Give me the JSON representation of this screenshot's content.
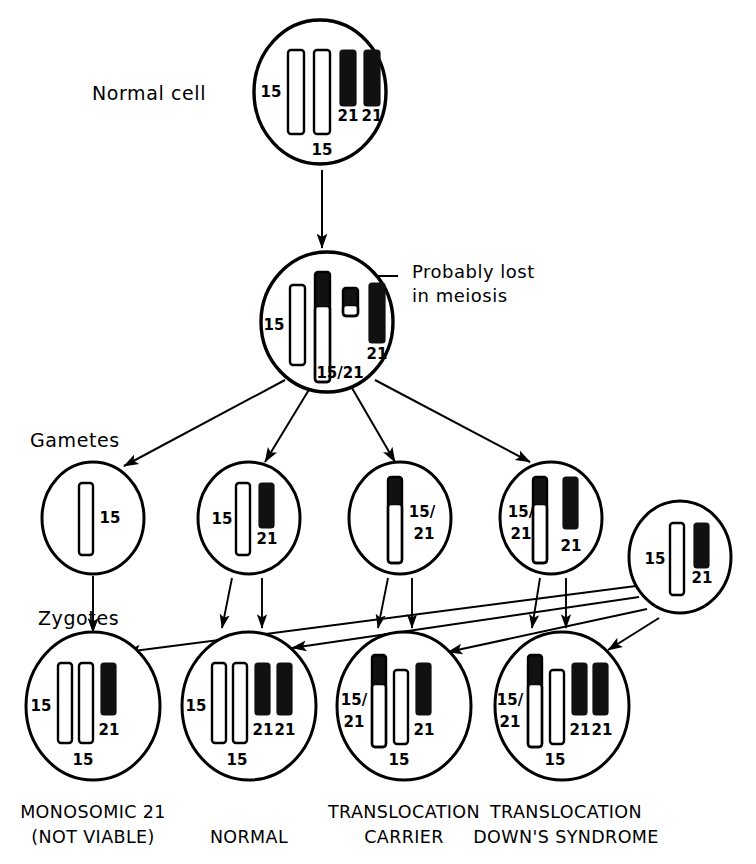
{
  "figure": {
    "line_color": "#000000",
    "fill_white": "#ffffff",
    "fill_black": "#111111"
  },
  "row_labels": {
    "normal_cell": "Normal cell",
    "gametes": "Gametes",
    "zygotes": "Zygotes"
  },
  "annotations": {
    "probably_lost_line1": "Probably lost",
    "probably_lost_line2": "in meiosis"
  },
  "cells": {
    "normal_cell": {
      "name": "normal-cell",
      "cx": 320,
      "cy": 92,
      "rx": 66,
      "ry": 72,
      "chromosomes": [
        {
          "id": "n15a",
          "type": "white",
          "x": 288,
          "y": 50,
          "w": 16,
          "h": 84
        },
        {
          "id": "n15b",
          "type": "white",
          "x": 314,
          "y": 50,
          "w": 16,
          "h": 84
        },
        {
          "id": "n21a",
          "type": "black",
          "x": 340,
          "y": 50,
          "w": 16,
          "h": 56
        },
        {
          "id": "n21b",
          "type": "black",
          "x": 364,
          "y": 50,
          "w": 16,
          "h": 56
        }
      ],
      "labels": [
        {
          "text": "15",
          "x": 271,
          "y": 92,
          "anchor": "middle"
        },
        {
          "text": "15",
          "x": 322,
          "y": 150,
          "anchor": "middle"
        },
        {
          "text": "21",
          "x": 348,
          "y": 116,
          "anchor": "middle"
        },
        {
          "text": "21",
          "x": 372,
          "y": 116,
          "anchor": "middle"
        }
      ]
    },
    "meiosis_cell": {
      "name": "meiosis-cell",
      "cx": 327,
      "cy": 322,
      "rx": 66,
      "ry": 70,
      "chromosomes": [
        {
          "id": "m15",
          "type": "white",
          "x": 290,
          "y": 285,
          "w": 15,
          "h": 80
        },
        {
          "id": "m1521",
          "type": "split",
          "x": 315,
          "y": 272,
          "w": 15,
          "h": 110,
          "black_h": 34
        },
        {
          "id": "mfrag",
          "type": "split",
          "x": 343,
          "y": 288,
          "w": 15,
          "h": 28,
          "black_h": 17
        },
        {
          "id": "m21",
          "type": "black",
          "x": 369,
          "y": 283,
          "w": 16,
          "h": 60
        }
      ],
      "labels": [
        {
          "text": "15",
          "x": 274,
          "y": 325,
          "anchor": "middle"
        },
        {
          "text": "15/21",
          "x": 340,
          "y": 373,
          "anchor": "middle"
        },
        {
          "text": "21",
          "x": 377,
          "y": 354,
          "anchor": "middle"
        }
      ]
    },
    "gametes": [
      {
        "name": "gamete-15",
        "cx": 93,
        "cy": 518,
        "rx": 51,
        "ry": 56,
        "chromosomes": [
          {
            "id": "g1-15",
            "type": "white",
            "x": 79,
            "y": 483,
            "w": 14,
            "h": 72
          }
        ],
        "labels": [
          {
            "text": "15",
            "x": 110,
            "y": 518,
            "anchor": "middle"
          }
        ]
      },
      {
        "name": "gamete-15-21",
        "cx": 249,
        "cy": 518,
        "rx": 51,
        "ry": 56,
        "chromosomes": [
          {
            "id": "g2-15",
            "type": "white",
            "x": 236,
            "y": 483,
            "w": 14,
            "h": 72
          },
          {
            "id": "g2-21",
            "type": "black",
            "x": 259,
            "y": 483,
            "w": 15,
            "h": 45
          }
        ],
        "labels": [
          {
            "text": "15",
            "x": 222,
            "y": 519,
            "anchor": "middle"
          },
          {
            "text": "21",
            "x": 267,
            "y": 539,
            "anchor": "middle"
          }
        ]
      },
      {
        "name": "gamete-translocation",
        "cx": 400,
        "cy": 518,
        "rx": 51,
        "ry": 56,
        "chromosomes": [
          {
            "id": "g3-1521",
            "type": "split",
            "x": 388,
            "y": 477,
            "w": 14,
            "h": 86,
            "black_h": 27
          }
        ],
        "labels": [
          {
            "text": "15/",
            "x": 422,
            "y": 512,
            "anchor": "middle"
          },
          {
            "text": "21",
            "x": 424,
            "y": 534,
            "anchor": "middle"
          }
        ]
      },
      {
        "name": "gamete-translocation-plus-21",
        "cx": 551,
        "cy": 518,
        "rx": 51,
        "ry": 56,
        "chromosomes": [
          {
            "id": "g4-1521",
            "type": "split",
            "x": 533,
            "y": 477,
            "w": 14,
            "h": 86,
            "black_h": 27
          },
          {
            "id": "g4-21",
            "type": "black",
            "x": 563,
            "y": 477,
            "w": 15,
            "h": 52
          }
        ],
        "labels": [
          {
            "text": "15/",
            "x": 521,
            "y": 512,
            "anchor": "middle"
          },
          {
            "text": "21",
            "x": 521,
            "y": 534,
            "anchor": "middle"
          },
          {
            "text": "21",
            "x": 571,
            "y": 546,
            "anchor": "middle"
          }
        ]
      },
      {
        "name": "gamete-paternal-normal",
        "cx": 680,
        "cy": 557,
        "rx": 51,
        "ry": 56,
        "chromosomes": [
          {
            "id": "g5-15",
            "type": "white",
            "x": 670,
            "y": 523,
            "w": 14,
            "h": 72
          },
          {
            "id": "g5-21",
            "type": "black",
            "x": 694,
            "y": 523,
            "w": 15,
            "h": 45
          }
        ],
        "labels": [
          {
            "text": "15",
            "x": 655,
            "y": 559,
            "anchor": "middle"
          },
          {
            "text": "21",
            "x": 702,
            "y": 578,
            "anchor": "middle"
          }
        ]
      }
    ],
    "zygotes": [
      {
        "name": "zygote-monosomic-21",
        "cx": 93,
        "cy": 706,
        "rx": 67,
        "ry": 74,
        "caption_line1": "MONOSOMIC 21",
        "caption_line2": "(NOT VIABLE)",
        "caption_x": 93,
        "chromosomes": [
          {
            "id": "z1-15a",
            "type": "white",
            "x": 58,
            "y": 663,
            "w": 14,
            "h": 80
          },
          {
            "id": "z1-15b",
            "type": "white",
            "x": 79,
            "y": 663,
            "w": 14,
            "h": 80
          },
          {
            "id": "z1-21",
            "type": "black",
            "x": 101,
            "y": 663,
            "w": 15,
            "h": 52
          }
        ],
        "labels": [
          {
            "text": "15",
            "x": 41,
            "y": 706,
            "anchor": "middle"
          },
          {
            "text": "15",
            "x": 83,
            "y": 760,
            "anchor": "middle"
          },
          {
            "text": "21",
            "x": 109,
            "y": 730,
            "anchor": "middle"
          }
        ]
      },
      {
        "name": "zygote-normal",
        "cx": 249,
        "cy": 706,
        "rx": 67,
        "ry": 74,
        "caption_line1": "NORMAL",
        "caption_line2": "",
        "caption_x": 249,
        "chromosomes": [
          {
            "id": "z2-15a",
            "type": "white",
            "x": 212,
            "y": 663,
            "w": 14,
            "h": 80
          },
          {
            "id": "z2-15b",
            "type": "white",
            "x": 233,
            "y": 663,
            "w": 14,
            "h": 80
          },
          {
            "id": "z2-21a",
            "type": "black",
            "x": 255,
            "y": 663,
            "w": 15,
            "h": 52
          },
          {
            "id": "z2-21b",
            "type": "black",
            "x": 277,
            "y": 663,
            "w": 15,
            "h": 52
          }
        ],
        "labels": [
          {
            "text": "15",
            "x": 196,
            "y": 706,
            "anchor": "middle"
          },
          {
            "text": "15",
            "x": 237,
            "y": 760,
            "anchor": "middle"
          },
          {
            "text": "21",
            "x": 263,
            "y": 730,
            "anchor": "middle"
          },
          {
            "text": "21",
            "x": 285,
            "y": 730,
            "anchor": "middle"
          }
        ]
      },
      {
        "name": "zygote-translocation-carrier",
        "cx": 404,
        "cy": 706,
        "rx": 67,
        "ry": 74,
        "caption_line1": "TRANSLOCATION",
        "caption_line2": "CARRIER",
        "caption_x": 404,
        "chromosomes": [
          {
            "id": "z3-1521",
            "type": "split",
            "x": 372,
            "y": 655,
            "w": 14,
            "h": 92,
            "black_h": 29
          },
          {
            "id": "z3-15",
            "type": "white",
            "x": 394,
            "y": 670,
            "w": 14,
            "h": 74
          },
          {
            "id": "z3-21",
            "type": "black",
            "x": 416,
            "y": 663,
            "w": 15,
            "h": 52
          }
        ],
        "labels": [
          {
            "text": "15/",
            "x": 354,
            "y": 700,
            "anchor": "middle"
          },
          {
            "text": "21",
            "x": 354,
            "y": 722,
            "anchor": "middle"
          },
          {
            "text": "15",
            "x": 399,
            "y": 760,
            "anchor": "middle"
          },
          {
            "text": "21",
            "x": 424,
            "y": 730,
            "anchor": "middle"
          }
        ]
      },
      {
        "name": "zygote-translocation-downs",
        "cx": 562,
        "cy": 706,
        "rx": 67,
        "ry": 74,
        "caption_line1": "TRANSLOCATION",
        "caption_line2": "DOWN'S SYNDROME",
        "caption_x": 566,
        "chromosomes": [
          {
            "id": "z4-1521",
            "type": "split",
            "x": 528,
            "y": 655,
            "w": 14,
            "h": 92,
            "black_h": 29
          },
          {
            "id": "z4-15",
            "type": "white",
            "x": 550,
            "y": 670,
            "w": 14,
            "h": 74
          },
          {
            "id": "z4-21a",
            "type": "black",
            "x": 572,
            "y": 663,
            "w": 15,
            "h": 52
          },
          {
            "id": "z4-21b",
            "type": "black",
            "x": 593,
            "y": 663,
            "w": 15,
            "h": 52
          }
        ],
        "labels": [
          {
            "text": "15/",
            "x": 510,
            "y": 700,
            "anchor": "middle"
          },
          {
            "text": "21",
            "x": 510,
            "y": 722,
            "anchor": "middle"
          },
          {
            "text": "15",
            "x": 555,
            "y": 760,
            "anchor": "middle"
          },
          {
            "text": "21",
            "x": 580,
            "y": 730,
            "anchor": "middle"
          },
          {
            "text": "21",
            "x": 602,
            "y": 730,
            "anchor": "middle"
          }
        ]
      }
    ]
  },
  "label_positions": {
    "normal_cell": {
      "x": 92,
      "y": 100
    },
    "gametes": {
      "x": 30,
      "y": 447
    },
    "zygotes": {
      "x": 38,
      "y": 625
    },
    "probably_lost": {
      "x": 412,
      "y": 278
    },
    "in_meiosis": {
      "x": 412,
      "y": 302
    }
  },
  "arrows": {
    "mitosis": {
      "from": [
        322,
        170
      ],
      "to": [
        322,
        248
      ]
    },
    "meiosis_fan": [
      {
        "from": [
          285,
          380
        ],
        "to": [
          124,
          466
        ]
      },
      {
        "from": [
          310,
          388
        ],
        "to": [
          265,
          462
        ]
      },
      {
        "from": [
          352,
          388
        ],
        "to": [
          395,
          462
        ]
      },
      {
        "from": [
          375,
          380
        ],
        "to": [
          530,
          462
        ]
      }
    ],
    "gamete_to_zygote": [
      {
        "from": [
          93,
          576
        ],
        "to": [
          93,
          632
        ]
      },
      {
        "from": [
          232,
          578
        ],
        "to": [
          222,
          628
        ]
      },
      {
        "from": [
          262,
          578
        ],
        "to": [
          262,
          628
        ]
      },
      {
        "from": [
          388,
          578
        ],
        "to": [
          378,
          628
        ]
      },
      {
        "from": [
          412,
          578
        ],
        "to": [
          412,
          628
        ]
      },
      {
        "from": [
          540,
          578
        ],
        "to": [
          532,
          628
        ]
      },
      {
        "from": [
          566,
          578
        ],
        "to": [
          566,
          628
        ]
      }
    ],
    "paternal_lines": [
      {
        "from": [
          636,
          586
        ],
        "to": [
          126,
          652
        ]
      },
      {
        "from": [
          639,
          597
        ],
        "to": [
          292,
          648
        ]
      },
      {
        "from": [
          647,
          609
        ],
        "to": [
          448,
          652
        ]
      },
      {
        "from": [
          659,
          618
        ],
        "to": [
          608,
          650
        ]
      }
    ],
    "leader_line": {
      "points": "398,276 344,276 344,290"
    }
  }
}
